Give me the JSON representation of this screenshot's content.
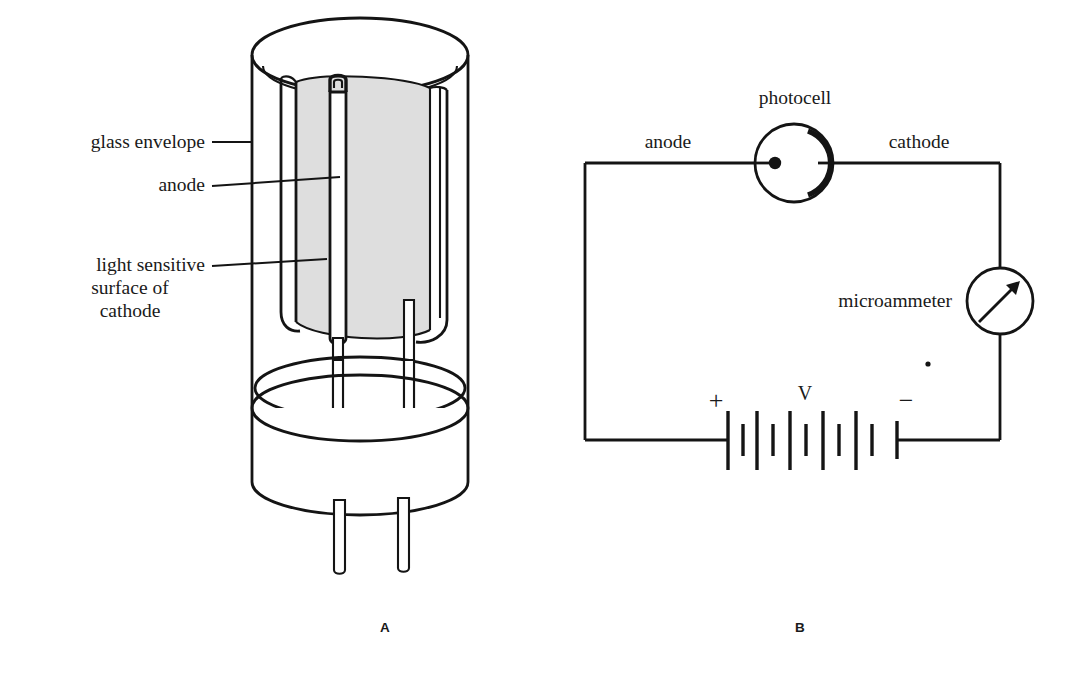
{
  "figure": {
    "background_color": "#ffffff",
    "ink_color": "#141414",
    "shade_color": "#dedede"
  },
  "panel_a": {
    "letter": "A",
    "caption_x": 385,
    "caption_y": 632,
    "labels": [
      {
        "id": "glass-envelope",
        "text": "glass envelope",
        "anchor": "end",
        "x": 205,
        "y": 148
      },
      {
        "id": "anode",
        "text": "anode",
        "anchor": "end",
        "x": 205,
        "y": 191
      },
      {
        "id": "light-sensitive-line1",
        "text": "light sensitive",
        "anchor": "end",
        "x": 205,
        "y": 271
      },
      {
        "id": "light-sensitive-line2",
        "text": "surface of",
        "anchor": "middle",
        "x": 130,
        "y": 294
      },
      {
        "id": "light-sensitive-line3",
        "text": "cathode",
        "anchor": "middle",
        "x": 130,
        "y": 317
      }
    ]
  },
  "panel_b": {
    "letter": "B",
    "caption_x": 800,
    "caption_y": 632,
    "labels": [
      {
        "id": "photocell",
        "text": "photocell",
        "anchor": "middle",
        "x": 795,
        "y": 104
      },
      {
        "id": "anode",
        "text": "anode",
        "anchor": "middle",
        "x": 668,
        "y": 148
      },
      {
        "id": "cathode",
        "text": "cathode",
        "anchor": "middle",
        "x": 919,
        "y": 148
      },
      {
        "id": "microammeter",
        "text": "microammeter",
        "anchor": "end",
        "x": 952,
        "y": 307
      }
    ],
    "battery": {
      "positive_sign": "+",
      "positive_x": 716,
      "negative_sign": "−",
      "negative_x": 906,
      "voltage_label": "V",
      "voltage_x": 805,
      "sign_y": 409,
      "plate_count": 10
    }
  }
}
